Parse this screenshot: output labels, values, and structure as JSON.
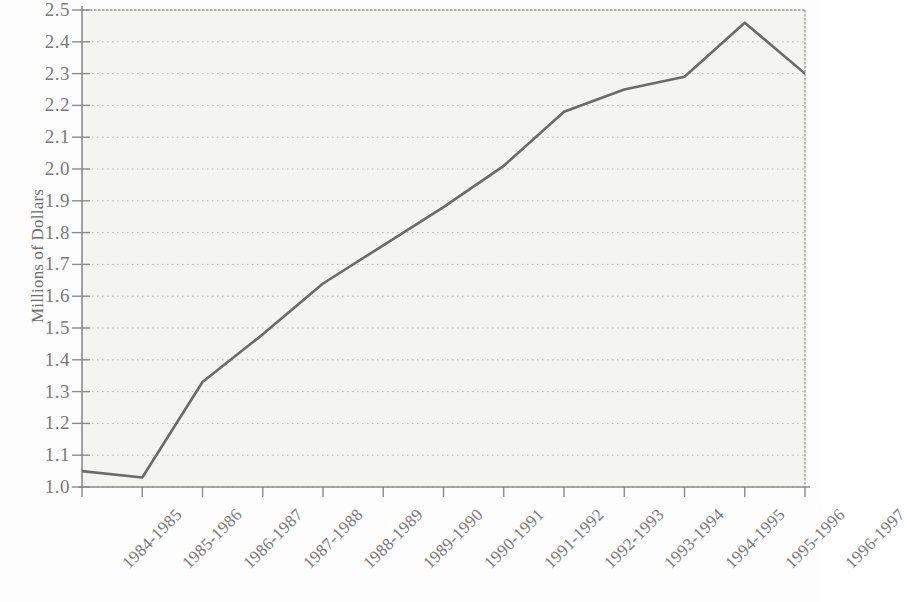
{
  "chart_data": {
    "type": "line",
    "title": "",
    "xlabel": "",
    "ylabel": "Millions of Dollars",
    "categories": [
      "1984-1985",
      "1985-1986",
      "1986-1987",
      "1987-1988",
      "1988-1989",
      "1989-1990",
      "1990-1991",
      "1991-1992",
      "1992-1993",
      "1993-1994",
      "1994-1995",
      "1995-1996",
      "1996-1997"
    ],
    "values": [
      1.05,
      1.03,
      1.33,
      1.48,
      1.64,
      1.76,
      1.88,
      2.01,
      2.18,
      2.25,
      2.29,
      2.46,
      2.3
    ],
    "ylim": [
      1.0,
      2.5
    ],
    "ytick_labels": [
      "2.5",
      "2.4",
      "2.3",
      "2.2",
      "2.1",
      "2.0",
      "1.9",
      "1.8",
      "1.7",
      "1.6",
      "1.5",
      "1.4",
      "1.3",
      "1.2",
      "1.1",
      "1.0"
    ],
    "ytick_values": [
      2.5,
      2.4,
      2.3,
      2.2,
      2.1,
      2.0,
      1.9,
      1.8,
      1.7,
      1.6,
      1.5,
      1.4,
      1.3,
      1.2,
      1.1,
      1.0
    ],
    "grid": true,
    "grid_style": "dotted-horizontal",
    "legend": null,
    "legend_position": "none",
    "series_color": "#6b6b6b",
    "grid_color": "#b9b9b9",
    "axis_color": "#8d8d8d",
    "plot_background": "#f6f6f4",
    "page_background": "#ffffff",
    "text_color": "#7a7a7a"
  }
}
